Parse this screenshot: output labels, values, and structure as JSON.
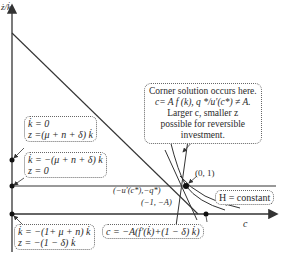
{
  "diagram": {
    "y_axis_label": "ż/k̇",
    "x_axis_label": "c",
    "points": {
      "corner": "(0, 1)",
      "costate": "(−u′(c*),−q*)",
      "slope": "(−1, −A)"
    },
    "boxes": {
      "kdot_zero": {
        "line1": "k̇ = 0",
        "line2": "z =(μ + n + δ) k̇"
      },
      "z_zero": {
        "line1": "k̇ = −(μ + n + δ) k̇",
        "line2": "z = 0"
      },
      "bottom_left": {
        "line1": "k̇ = −(1+ μ + n) k̇",
        "line2": "z = −(1 − δ) k̇"
      },
      "bottom_right": {
        "line1": "c = −A(f′(k̇)+(1 − δ) k̇)"
      },
      "hamiltonian": "H = constant"
    },
    "callout": {
      "line1": "Corner solution occurs here.",
      "line2": "c= A f (k), q */u′(c*) ≠ A.",
      "line3": "Larger c, smaller z",
      "line4": "possible for reversible",
      "line5": "investment."
    },
    "colors": {
      "line": "#333333",
      "box_border": "#666666",
      "background": "#ffffff"
    }
  }
}
